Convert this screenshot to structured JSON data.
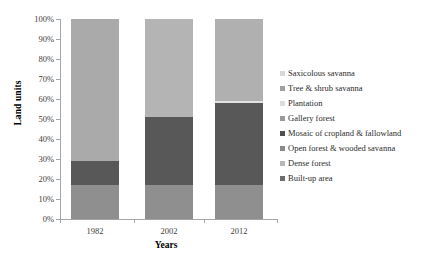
{
  "chart_data": {
    "type": "bar",
    "stacked": true,
    "normalized": "100%",
    "title": "",
    "xlabel": "Years",
    "ylabel": "Land units",
    "categories": [
      "1982",
      "2002",
      "2012"
    ],
    "ylim": [
      0,
      100
    ],
    "ytick_labels": [
      "0%",
      "10%",
      "20%",
      "30%",
      "40%",
      "50%",
      "60%",
      "70%",
      "80%",
      "90%",
      "100%"
    ],
    "ytick_values": [
      0,
      10,
      20,
      30,
      40,
      50,
      60,
      70,
      80,
      90,
      100
    ],
    "grid": false,
    "legend_position": "right",
    "series": [
      {
        "name": "Saxicolous savanna",
        "color": "#d3d3d3",
        "values": [
          0,
          0,
          0
        ]
      },
      {
        "name": "Tree & shrub savanna",
        "color": "#a9a9a9",
        "values": [
          71,
          49,
          41
        ]
      },
      {
        "name": "Plantation",
        "color": "#e0e0e0",
        "values": [
          0,
          0,
          1
        ]
      },
      {
        "name": "Gallery forest",
        "color": "#9e9e9e",
        "values": [
          0,
          0,
          0
        ]
      },
      {
        "name": "Mosaic of cropland & fallowland",
        "color": "#585858",
        "values": [
          12,
          34,
          41
        ]
      },
      {
        "name": "Open forest & wooded savanna",
        "color": "#8f8f8f",
        "values": [
          17,
          17,
          17
        ]
      },
      {
        "name": "Dense forest",
        "color": "#bdbdbd",
        "values": [
          0,
          0,
          0
        ]
      },
      {
        "name": "Built-up area",
        "color": "#707070",
        "values": [
          0,
          0,
          0
        ]
      }
    ],
    "stack_order_bottom_to_top": [
      "Built-up area",
      "Dense forest",
      "Open forest & wooded savanna",
      "Mosaic of cropland & fallowland",
      "Gallery forest",
      "Plantation",
      "Tree & shrub savanna",
      "Saxicolous savanna"
    ],
    "bars": [
      {
        "category": "1982",
        "segments": [
          {
            "name": "Open forest & wooded savanna",
            "from": 0,
            "to": 17,
            "color": "#8f8f8f"
          },
          {
            "name": "Mosaic of cropland & fallowland",
            "from": 17,
            "to": 29,
            "color": "#585858"
          },
          {
            "name": "Tree & shrub savanna",
            "from": 29,
            "to": 100,
            "color": "#aaaaaa"
          }
        ]
      },
      {
        "category": "2002",
        "segments": [
          {
            "name": "Open forest & wooded savanna",
            "from": 0,
            "to": 17,
            "color": "#8f8f8f"
          },
          {
            "name": "Mosaic of cropland & fallowland",
            "from": 17,
            "to": 51,
            "color": "#585858"
          },
          {
            "name": "Tree & shrub savanna",
            "from": 51,
            "to": 100,
            "color": "#b4b4b4"
          }
        ]
      },
      {
        "category": "2012",
        "segments": [
          {
            "name": "Open forest & wooded savanna",
            "from": 0,
            "to": 17,
            "color": "#8f8f8f"
          },
          {
            "name": "Mosaic of cropland & fallowland",
            "from": 17,
            "to": 58,
            "color": "#585858"
          },
          {
            "name": "Plantation",
            "from": 58,
            "to": 59,
            "color": "#e2e2e2"
          },
          {
            "name": "Tree & shrub savanna",
            "from": 59,
            "to": 100,
            "color": "#b0b0b0"
          }
        ]
      }
    ]
  },
  "legend": {
    "items": [
      {
        "label": "Saxicolous savanna",
        "color": "#d8d8d8"
      },
      {
        "label": "Tree & shrub savanna",
        "color": "#a0a0a0"
      },
      {
        "label": "Plantation",
        "color": "#dcdcdc"
      },
      {
        "label": "Gallery forest",
        "color": "#9a9a9a"
      },
      {
        "label": "Mosaic of cropland & fallowland",
        "color": "#4f4f4f"
      },
      {
        "label": "Open forest & wooded savanna",
        "color": "#8a8a8a"
      },
      {
        "label": "Dense forest",
        "color": "#b8b8b8"
      },
      {
        "label": "Built-up area",
        "color": "#6e6e6e"
      }
    ]
  },
  "axes": {
    "y_title": "Land units",
    "x_title": "Years",
    "y_labels": [
      "100%",
      "90%",
      "80%",
      "70%",
      "60%",
      "50%",
      "40%",
      "30%",
      "20%",
      "10%",
      "0%"
    ],
    "x_labels": [
      "1982",
      "2002",
      "2012"
    ]
  }
}
